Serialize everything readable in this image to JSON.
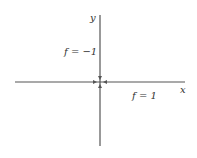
{
  "diagram": {
    "axes": {
      "x_label": "x",
      "y_label": "y",
      "color": "#555555"
    },
    "regions": [
      {
        "label": "f = −1",
        "position": "upper-left of y-axis"
      },
      {
        "label": "f = 1",
        "position": "below right x-axis"
      }
    ],
    "arrows": [
      {
        "direction": "down",
        "toward": "origin"
      },
      {
        "direction": "up",
        "toward": "origin"
      },
      {
        "direction": "right",
        "toward": "origin"
      },
      {
        "direction": "left",
        "toward": "origin"
      }
    ]
  }
}
